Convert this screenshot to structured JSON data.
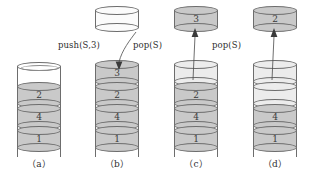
{
  "figure": {
    "type": "stack-operation-diagram",
    "panel_count": 4
  },
  "panels": [
    {
      "id": "a",
      "caption": "（a）",
      "operation_label": "",
      "floating_disc": null,
      "stack_discs": [
        "2",
        "4",
        "1"
      ],
      "empty_slots": 0,
      "light_slots": 0
    },
    {
      "id": "b",
      "caption": "（b）",
      "operation_label": "push(S,3)",
      "floating_disc": {
        "label": "",
        "style": "white"
      },
      "stack_discs": [
        "3",
        "2",
        "4",
        "1"
      ],
      "empty_slots": 0,
      "light_slots": 0
    },
    {
      "id": "c",
      "caption": "（c）",
      "operation_label": "pop(S)",
      "floating_disc": {
        "label": "3",
        "style": "gray"
      },
      "stack_discs": [
        "2",
        "4",
        "1"
      ],
      "empty_slots": 0,
      "light_slots": 1
    },
    {
      "id": "d",
      "caption": "（d）",
      "operation_label": "pop(S)",
      "floating_disc": {
        "label": "2",
        "style": "gray"
      },
      "stack_discs": [
        "4",
        "1"
      ],
      "empty_slots": 0,
      "light_slots": 2
    }
  ],
  "colors": {
    "disc_fill": "#c9c9c9",
    "light_fill": "#ececec",
    "white_fill": "#fbfbfb",
    "outline": "#6d6d6d",
    "text": "#2e2e2e",
    "background": "#ffffff"
  },
  "icons": {
    "arrow_down": "arrow-down-icon",
    "arrow_up": "arrow-up-icon"
  }
}
